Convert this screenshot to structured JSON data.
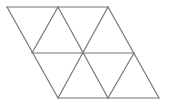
{
  "diagram": {
    "stroke_color": "#777777",
    "background": "#ffffff",
    "vertices": {
      "top": [
        [
          7,
          7
        ],
        [
          58,
          7
        ],
        [
          108,
          7
        ]
      ],
      "middle": [
        [
          32,
          53
        ],
        [
          83,
          53
        ],
        [
          134,
          53
        ]
      ],
      "bottom": [
        [
          58,
          98
        ],
        [
          108,
          98
        ],
        [
          159,
          98
        ]
      ]
    },
    "triangle_count": 8
  }
}
